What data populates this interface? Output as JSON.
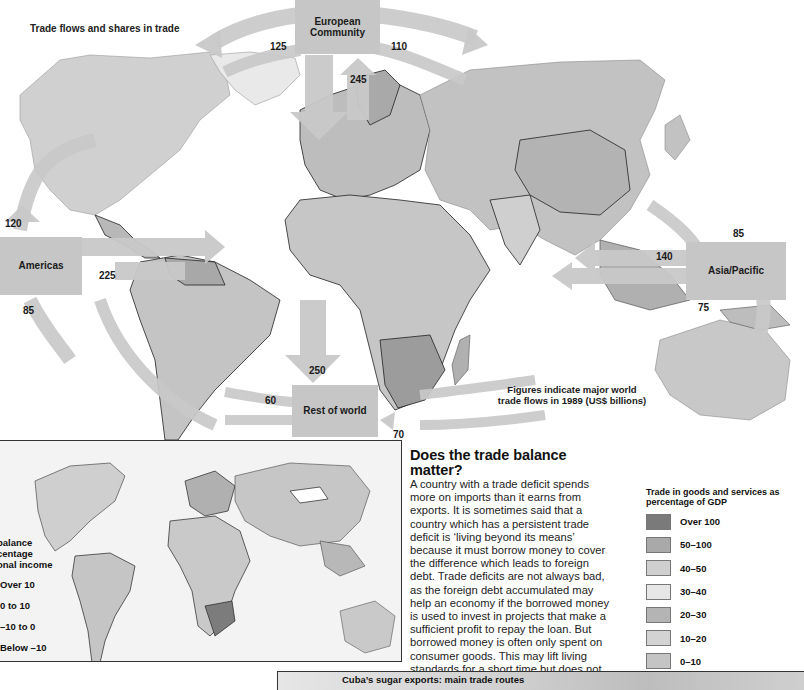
{
  "map": {
    "title": "Trade flows and shares in trade",
    "regions": {
      "european_community": "European Community",
      "americas": "Americas",
      "asia_pacific": "Asia/Pacific",
      "rest_of_world": "Rest of world"
    },
    "flows": {
      "ec_to_americas": "125",
      "ec_to_asia": "110",
      "ec_internal": "245",
      "americas_from_north": "120",
      "americas_internal": "225",
      "americas_outbound": "85",
      "asia_internal": "140",
      "asia_from_north": "85",
      "asia_outbound": "75",
      "ec_to_rest": "250",
      "rest_inbound": "60",
      "rest_to_asia": "70"
    },
    "note": "Figures indicate major world trade flows in 1989 (US$ billions)",
    "colors": {
      "arrow": "#c9c9c9",
      "land_light": "#d4d4d4",
      "land_mid": "#b8b8b8",
      "land_dark": "#8f8f8f",
      "border": "#1a1a1a"
    }
  },
  "article": {
    "heading": "Does the trade balance matter?",
    "body": "A country with a trade deficit spends more on imports than it earns from exports. It is sometimes said that a country which has a persistent trade deficit is ‘living beyond its means’ because it must borrow money to cover the difference which leads to foreign debt. Trade deficits are not always bad, as the foreign debt accumulated may help an economy if the borrowed money is used to invest in projects that make a sufficient profit to repay the loan. But borrowed money is often only spent on consumer goods. This may lift living standards for a short time but does not lead to economic growth in the long run."
  },
  "legend_gdp": {
    "title": "Trade in goods and services as percentage of GDP",
    "items": [
      {
        "label": "Over 100",
        "color": "#7a7a7a"
      },
      {
        "label": "50–100",
        "color": "#a9a9a9"
      },
      {
        "label": "40–50",
        "color": "#cfcfcf"
      },
      {
        "label": "30–40",
        "color": "#e6e6e6"
      },
      {
        "label": "20–30",
        "color": "#b4b4b4"
      },
      {
        "label": "10–20",
        "color": "#d3d3d3"
      },
      {
        "label": "0–10",
        "color": "#c4c4c4"
      }
    ]
  },
  "legend_balance": {
    "title_lines": [
      "balance",
      "centage",
      "onal income"
    ],
    "items": [
      "Over 10",
      "0 to 10",
      "–10 to 0",
      "Below –10"
    ]
  },
  "cuba_panel": {
    "title": "Cuba’s sugar exports: main trade routes"
  }
}
